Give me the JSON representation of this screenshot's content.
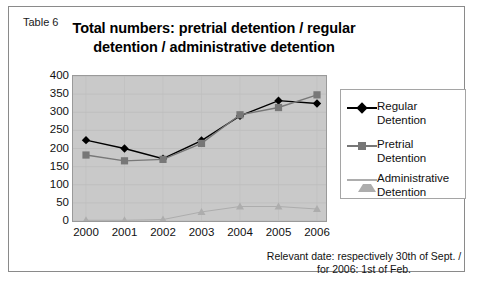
{
  "table_label": "Table 6",
  "title": "Total numbers: pretrial detention / regular detention / administrative detention",
  "footnote_line1": "Relevant date: respectively 30th of Sept. /",
  "footnote_line2": "for 2006: 1st of Feb.",
  "legend": {
    "items": [
      {
        "label": "Regular Detention",
        "marker": "diamond-marker",
        "color": "#000000"
      },
      {
        "label": "Pretrial Detention",
        "marker": "square-marker",
        "color": "#777777"
      },
      {
        "label": "Administrative\nDetention",
        "marker": "triangle-marker",
        "color": "#adadad"
      }
    ]
  },
  "chart_data": {
    "type": "line",
    "title": "Total numbers: pretrial detention / regular detention / administrative detention",
    "xlabel": "",
    "ylabel": "",
    "x": [
      "2000",
      "2001",
      "2002",
      "2003",
      "2004",
      "2005",
      "2006"
    ],
    "categories": [
      "2000",
      "2001",
      "2002",
      "2003",
      "2004",
      "2005",
      "2006"
    ],
    "ylim": [
      0,
      400
    ],
    "yticks": [
      0,
      50,
      100,
      150,
      200,
      250,
      300,
      350,
      400
    ],
    "ytick_labels": [
      "0",
      "50",
      "100",
      "150",
      "200",
      "250",
      "300",
      "350",
      "400"
    ],
    "grid": true,
    "legend_position": "right",
    "plot_background": "#c9c9c9",
    "series": [
      {
        "name": "Regular Detention",
        "color": "#000000",
        "marker": "diamond",
        "values": [
          223,
          200,
          172,
          222,
          290,
          332,
          324
        ]
      },
      {
        "name": "Pretrial Detention",
        "color": "#777777",
        "marker": "square",
        "values": [
          182,
          166,
          170,
          214,
          293,
          313,
          348
        ]
      },
      {
        "name": "Administrative Detention",
        "color": "#adadad",
        "marker": "triangle",
        "values": [
          2,
          2,
          4,
          25,
          40,
          40,
          33
        ]
      }
    ]
  }
}
